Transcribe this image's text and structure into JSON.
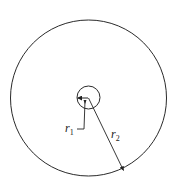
{
  "diagram": {
    "title": "",
    "outer_circle": {
      "cx": 88.5,
      "cy": 98,
      "r": 78,
      "stroke": "#2a2a2a"
    },
    "inner_circle": {
      "cx": 88.5,
      "cy": 97.5,
      "r": 11.5,
      "stroke": "#2a2a2a"
    },
    "labels": {
      "r1": {
        "base": "r",
        "sub": "1"
      },
      "r2": {
        "base": "r",
        "sub": "2"
      }
    }
  }
}
